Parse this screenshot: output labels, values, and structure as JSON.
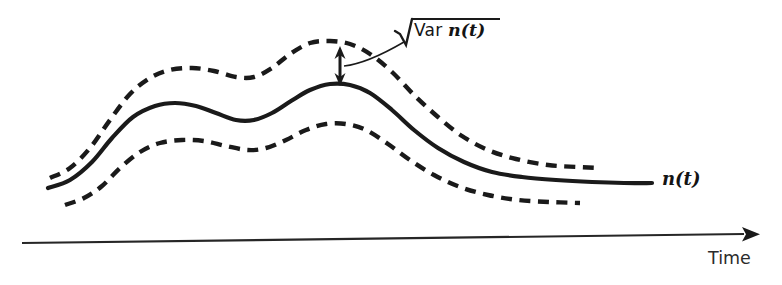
{
  "figure": {
    "title": "",
    "background_color": "#ffffff",
    "stroke_color": "#1a1a1a",
    "axis_color": "#262626"
  },
  "labels": {
    "sqrt_var_prefix": "Var ",
    "sqrt_var_italic": "n(t)",
    "mean_curve": "n(t)",
    "x_axis": "Time"
  },
  "annotations": {
    "measure_arrow_name": "standard-deviation-double-arrow",
    "measure_arrow_x": 340,
    "measure_arrow_top_y": 46,
    "measure_arrow_bottom_y": 86
  },
  "chart_data": {
    "type": "line",
    "title": "",
    "xlabel": "Time",
    "ylabel": "",
    "grid": false,
    "legend_position": "inline-right",
    "axis": {
      "x_start_px": 22,
      "x_end_px": 750,
      "y_px": 240,
      "arrow": "right",
      "ticks": [],
      "tick_labels": []
    },
    "series": [
      {
        "name": "n(t)",
        "style": "solid",
        "label": "n(t)",
        "points": [
          [
            48,
            188
          ],
          [
            70,
            180
          ],
          [
            92,
            162
          ],
          [
            112,
            138
          ],
          [
            133,
            117
          ],
          [
            155,
            106
          ],
          [
            175,
            103
          ],
          [
            196,
            106
          ],
          [
            216,
            113
          ],
          [
            236,
            120
          ],
          [
            254,
            120
          ],
          [
            272,
            113
          ],
          [
            291,
            101
          ],
          [
            310,
            90
          ],
          [
            330,
            84
          ],
          [
            350,
            85
          ],
          [
            370,
            93
          ],
          [
            392,
            110
          ],
          [
            414,
            130
          ],
          [
            438,
            148
          ],
          [
            464,
            162
          ],
          [
            492,
            172
          ],
          [
            522,
            177
          ],
          [
            556,
            180
          ],
          [
            592,
            182
          ],
          [
            624,
            183
          ],
          [
            652,
            183
          ]
        ]
      },
      {
        "name": "n(t) + sqrt(Var n(t))",
        "style": "dashed",
        "label": "",
        "points": [
          [
            50,
            178
          ],
          [
            70,
            168
          ],
          [
            90,
            148
          ],
          [
            110,
            120
          ],
          [
            130,
            94
          ],
          [
            150,
            78
          ],
          [
            170,
            70
          ],
          [
            192,
            68
          ],
          [
            214,
            71
          ],
          [
            236,
            77
          ],
          [
            254,
            77
          ],
          [
            272,
            68
          ],
          [
            290,
            54
          ],
          [
            310,
            43
          ],
          [
            330,
            41
          ],
          [
            350,
            44
          ],
          [
            370,
            54
          ],
          [
            392,
            72
          ],
          [
            414,
            95
          ],
          [
            438,
            117
          ],
          [
            462,
            136
          ],
          [
            488,
            150
          ],
          [
            516,
            159
          ],
          [
            548,
            165
          ],
          [
            578,
            167
          ],
          [
            598,
            168
          ]
        ]
      },
      {
        "name": "n(t) - sqrt(Var n(t))",
        "style": "dashed",
        "label": "",
        "points": [
          [
            65,
            205
          ],
          [
            84,
            198
          ],
          [
            102,
            186
          ],
          [
            120,
            168
          ],
          [
            140,
            152
          ],
          [
            160,
            143
          ],
          [
            182,
            140
          ],
          [
            204,
            141
          ],
          [
            226,
            146
          ],
          [
            248,
            150
          ],
          [
            266,
            148
          ],
          [
            286,
            140
          ],
          [
            306,
            130
          ],
          [
            326,
            124
          ],
          [
            346,
            124
          ],
          [
            366,
            130
          ],
          [
            388,
            144
          ],
          [
            410,
            160
          ],
          [
            434,
            175
          ],
          [
            460,
            187
          ],
          [
            488,
            195
          ],
          [
            518,
            200
          ],
          [
            550,
            202
          ],
          [
            580,
            203
          ]
        ]
      }
    ]
  }
}
